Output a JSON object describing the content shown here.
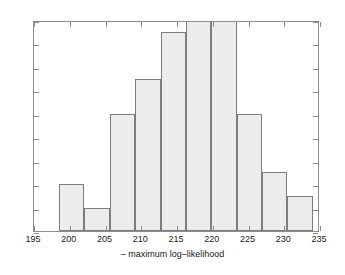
{
  "chart_data": {
    "type": "bar",
    "title": "",
    "subtitle": "",
    "xlabel": "– maximum log–likelihood",
    "ylabel": "",
    "grid": false,
    "legend": false,
    "xlim": [
      195,
      235
    ],
    "ylim": [
      0,
      18
    ],
    "bin_width": 3.55,
    "bin_edges": [
      198.5,
      202.05,
      205.6,
      209.15,
      212.7,
      216.25,
      219.8,
      223.35,
      226.9,
      230.45,
      234.0
    ],
    "categories": [
      "198.5-202.1",
      "202.1-205.6",
      "205.6-209.2",
      "209.2-212.7",
      "212.7-216.3",
      "216.3-219.8",
      "219.8-223.4",
      "223.4-226.9",
      "226.9-230.5",
      "230.5-234.0"
    ],
    "values": [
      4,
      2,
      10,
      13,
      17,
      18,
      18,
      10,
      5,
      3
    ],
    "xticks": [
      195,
      200,
      205,
      210,
      215,
      220,
      225,
      230,
      235
    ],
    "yticks": [
      0,
      2,
      4,
      6,
      8,
      10,
      12,
      14,
      16,
      18
    ],
    "xtick_labels": [
      "195",
      "200",
      "205",
      "210",
      "215",
      "220",
      "225",
      "230",
      "235"
    ],
    "ytick_labels": [
      "0",
      "2",
      "4",
      "6",
      "8",
      "10",
      "12",
      "14",
      "16",
      "18"
    ],
    "colors": {
      "bar_fill": "#ececec",
      "bar_edge": "#7d7d7d",
      "axis": "#8c8c8c",
      "text": "#1a1a1a",
      "background": "#ffffff"
    }
  }
}
